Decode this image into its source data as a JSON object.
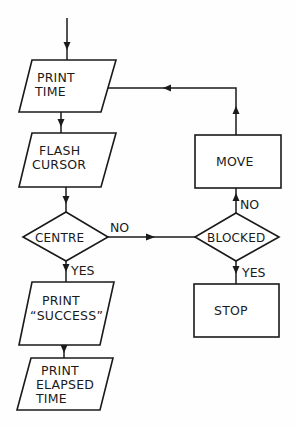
{
  "diagram": {
    "type": "flowchart",
    "nodes": [
      {
        "id": "print_time",
        "shape": "parallelogram",
        "lines": [
          "PRINT",
          "TIME"
        ]
      },
      {
        "id": "flash_cursor",
        "shape": "parallelogram",
        "lines": [
          "FLASH",
          "CURSOR"
        ]
      },
      {
        "id": "centre",
        "shape": "diamond",
        "lines": [
          "CENTRE"
        ]
      },
      {
        "id": "print_success",
        "shape": "parallelogram",
        "lines": [
          "PRINT",
          "“SUCCESS”"
        ]
      },
      {
        "id": "print_elapsed",
        "shape": "parallelogram",
        "lines": [
          "PRINT",
          "ELAPSED",
          "TIME"
        ]
      },
      {
        "id": "blocked",
        "shape": "diamond",
        "lines": [
          "BLOCKED"
        ]
      },
      {
        "id": "move",
        "shape": "rectangle",
        "lines": [
          "MOVE"
        ]
      },
      {
        "id": "stop",
        "shape": "rectangle",
        "lines": [
          "STOP"
        ]
      }
    ],
    "edges": [
      {
        "from": "start",
        "to": "print_time",
        "label": ""
      },
      {
        "from": "print_time",
        "to": "flash_cursor",
        "label": ""
      },
      {
        "from": "flash_cursor",
        "to": "centre",
        "label": ""
      },
      {
        "from": "centre",
        "to": "print_success",
        "label": "YES"
      },
      {
        "from": "centre",
        "to": "blocked",
        "label": "NO"
      },
      {
        "from": "print_success",
        "to": "print_elapsed",
        "label": ""
      },
      {
        "from": "blocked",
        "to": "move",
        "label": "NO"
      },
      {
        "from": "blocked",
        "to": "stop",
        "label": "YES"
      },
      {
        "from": "move",
        "to": "print_time",
        "label": ""
      }
    ],
    "edge_labels": {
      "centre_no": "NO",
      "centre_yes": "YES",
      "blocked_no": "NO",
      "blocked_yes": "YES"
    }
  }
}
